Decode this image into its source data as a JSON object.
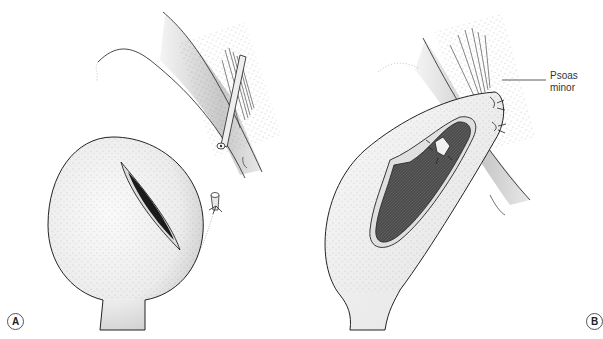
{
  "figure": {
    "panels": [
      {
        "id": "A",
        "label": "A",
        "description": "Bladder with incision and ligated ureter stump"
      },
      {
        "id": "B",
        "label": "B",
        "description": "Opened bladder hitched to psoas minor with ureteric reimplantation"
      }
    ],
    "annotations": [
      {
        "panel": "B",
        "lines": [
          "Psoas",
          "minor"
        ]
      }
    ],
    "colors": {
      "outline": "#222222",
      "bladder_fill": "#f0f0f0",
      "lumen_fill": "#555555",
      "vessel_fill": "#d8d8d8",
      "background": "#ffffff"
    }
  }
}
